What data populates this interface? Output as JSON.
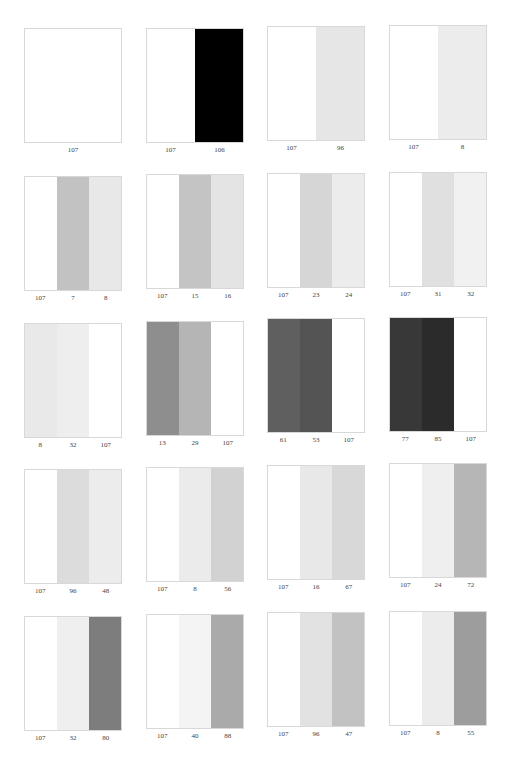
{
  "page": {
    "rows": 5,
    "columns": 4
  },
  "patches": [
    {
      "id": "r1c1",
      "row": 1,
      "col": 1,
      "strips": [
        {
          "label": "107",
          "color": "#ffffff"
        }
      ]
    },
    {
      "id": "r1c2",
      "row": 1,
      "col": 2,
      "strips": [
        {
          "label": "107",
          "color": "#ffffff"
        },
        {
          "label": "106",
          "color": "#000000"
        }
      ]
    },
    {
      "id": "r1c3",
      "row": 1,
      "col": 3,
      "strips": [
        {
          "label": "107",
          "color": "#ffffff"
        },
        {
          "label": "96",
          "color": "#e6e6e6"
        }
      ]
    },
    {
      "id": "r1c4",
      "row": 1,
      "col": 4,
      "strips": [
        {
          "label": "107",
          "color": "#ffffff"
        },
        {
          "label": "8",
          "color": "#ececec"
        }
      ]
    },
    {
      "id": "r2c1",
      "row": 2,
      "col": 1,
      "strips": [
        {
          "label": "107",
          "color": "#ffffff"
        },
        {
          "label": "7",
          "color": "#c2c2c2"
        },
        {
          "label": "8",
          "color": "#e8e8e8"
        }
      ]
    },
    {
      "id": "r2c2",
      "row": 2,
      "col": 2,
      "strips": [
        {
          "label": "107",
          "color": "#ffffff"
        },
        {
          "label": "15",
          "color": "#c4c4c4"
        },
        {
          "label": "16",
          "color": "#e4e4e4"
        }
      ]
    },
    {
      "id": "r2c3",
      "row": 2,
      "col": 3,
      "strips": [
        {
          "label": "107",
          "color": "#ffffff"
        },
        {
          "label": "23",
          "color": "#d6d6d6"
        },
        {
          "label": "24",
          "color": "#ececec"
        }
      ]
    },
    {
      "id": "r2c4",
      "row": 2,
      "col": 4,
      "strips": [
        {
          "label": "107",
          "color": "#ffffff"
        },
        {
          "label": "31",
          "color": "#e0e0e0"
        },
        {
          "label": "32",
          "color": "#f1f1f1"
        }
      ]
    },
    {
      "id": "r3c1",
      "row": 3,
      "col": 1,
      "strips": [
        {
          "label": "8",
          "color": "#e9e9e9"
        },
        {
          "label": "32",
          "color": "#eeeeee"
        },
        {
          "label": "107",
          "color": "#ffffff"
        }
      ]
    },
    {
      "id": "r3c2",
      "row": 3,
      "col": 2,
      "strips": [
        {
          "label": "13",
          "color": "#8e8e8e"
        },
        {
          "label": "29",
          "color": "#b5b5b5"
        },
        {
          "label": "107",
          "color": "#ffffff"
        }
      ]
    },
    {
      "id": "r3c3",
      "row": 3,
      "col": 3,
      "strips": [
        {
          "label": "61",
          "color": "#5f5f5f"
        },
        {
          "label": "53",
          "color": "#545454"
        },
        {
          "label": "107",
          "color": "#ffffff"
        }
      ]
    },
    {
      "id": "r3c4",
      "row": 3,
      "col": 4,
      "strips": [
        {
          "label": "77",
          "color": "#383838"
        },
        {
          "label": "85",
          "color": "#2b2b2b"
        },
        {
          "label": "107",
          "color": "#ffffff"
        }
      ]
    },
    {
      "id": "r4c1",
      "row": 4,
      "col": 1,
      "strips": [
        {
          "label": "107",
          "color": "#ffffff"
        },
        {
          "label": "96",
          "color": "#dcdcdc"
        },
        {
          "label": "48",
          "color": "#ececec"
        }
      ]
    },
    {
      "id": "r4c2",
      "row": 4,
      "col": 2,
      "strips": [
        {
          "label": "107",
          "color": "#ffffff"
        },
        {
          "label": "8",
          "color": "#ebebeb"
        },
        {
          "label": "56",
          "color": "#d2d2d2"
        }
      ]
    },
    {
      "id": "r4c3",
      "row": 4,
      "col": 3,
      "strips": [
        {
          "label": "107",
          "color": "#ffffff"
        },
        {
          "label": "16",
          "color": "#e8e8e8"
        },
        {
          "label": "67",
          "color": "#d8d8d8"
        }
      ]
    },
    {
      "id": "r4c4",
      "row": 4,
      "col": 4,
      "strips": [
        {
          "label": "107",
          "color": "#ffffff"
        },
        {
          "label": "24",
          "color": "#efefef"
        },
        {
          "label": "72",
          "color": "#b6b6b6"
        }
      ]
    },
    {
      "id": "r5c1",
      "row": 5,
      "col": 1,
      "strips": [
        {
          "label": "107",
          "color": "#ffffff"
        },
        {
          "label": "32",
          "color": "#efefef"
        },
        {
          "label": "80",
          "color": "#7d7d7d"
        }
      ]
    },
    {
      "id": "r5c2",
      "row": 5,
      "col": 2,
      "strips": [
        {
          "label": "107",
          "color": "#ffffff"
        },
        {
          "label": "40",
          "color": "#f4f4f4"
        },
        {
          "label": "88",
          "color": "#aaaaaa"
        }
      ]
    },
    {
      "id": "r5c3",
      "row": 5,
      "col": 3,
      "strips": [
        {
          "label": "107",
          "color": "#ffffff"
        },
        {
          "label": "96",
          "color": "#e2e2e2"
        },
        {
          "label": "47",
          "color": "#c2c2c2"
        }
      ]
    },
    {
      "id": "r5c4",
      "row": 5,
      "col": 4,
      "strips": [
        {
          "label": "107",
          "color": "#ffffff"
        },
        {
          "label": "8",
          "color": "#ececec"
        },
        {
          "label": "55",
          "color": "#9d9d9d"
        }
      ]
    }
  ],
  "layout": {
    "col_x": [
      24,
      146,
      267,
      389
    ],
    "row_y": [
      27,
      174,
      320,
      466,
      613
    ],
    "row_offsets": [
      [
        1,
        1,
        -1,
        -2
      ],
      [
        2,
        0,
        -1,
        -2
      ],
      [
        3,
        1,
        -2,
        -3
      ],
      [
        3,
        1,
        -1,
        -3
      ],
      [
        3,
        1,
        -1,
        -2
      ]
    ]
  }
}
